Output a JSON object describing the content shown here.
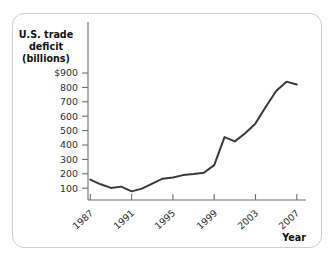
{
  "figure": {
    "frame_color": "#cfcfcf",
    "background": "#ffffff"
  },
  "axis": {
    "y_title_line1": "U.S. trade",
    "y_title_line2": "deficit",
    "y_title_line3": "(billions)",
    "x_title": "Year",
    "axis_color": "#6f6f6f",
    "label_color": "#2b2b2b"
  },
  "chart_data": {
    "type": "line",
    "title": "",
    "subtitle": "",
    "xlabel": "Year",
    "ylabel": "U.S. trade deficit (billions)",
    "xlim": [
      1986,
      2008
    ],
    "ylim": [
      0,
      950
    ],
    "grid": false,
    "legend": false,
    "legend_position": "none",
    "line_color": "#3a3a3a",
    "x_tick_labels": [
      "1987",
      "1991",
      "1995",
      "1999",
      "2003",
      "2007"
    ],
    "x_tick_values": [
      1987,
      1991,
      1995,
      1999,
      2003,
      2007
    ],
    "x_minor_ticks": [
      1987,
      1991,
      1995,
      1999,
      2003,
      2007
    ],
    "y_tick_labels": [
      "$900",
      "800",
      "700",
      "600",
      "500",
      "400",
      "300",
      "200",
      "100"
    ],
    "y_tick_values": [
      900,
      800,
      700,
      600,
      500,
      400,
      300,
      200,
      100
    ],
    "x": [
      1987,
      1988,
      1989,
      1990,
      1991,
      1992,
      1993,
      1994,
      1995,
      1996,
      1997,
      1998,
      1999,
      2000,
      2001,
      2002,
      2003,
      2004,
      2005,
      2006,
      2007
    ],
    "values": [
      160,
      127,
      102,
      111,
      78,
      97,
      132,
      166,
      174,
      191,
      198,
      207,
      260,
      455,
      425,
      482,
      550,
      665,
      775,
      840,
      820
    ],
    "series": [
      {
        "name": "U.S. trade deficit",
        "values": [
          160,
          127,
          102,
          111,
          78,
          97,
          132,
          166,
          174,
          191,
          198,
          207,
          260,
          455,
          425,
          482,
          550,
          665,
          775,
          840,
          820
        ]
      }
    ],
    "annotations": []
  }
}
